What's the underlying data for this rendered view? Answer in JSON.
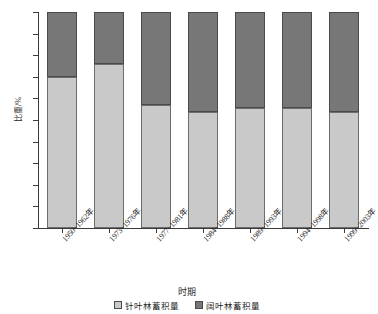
{
  "chart_data": {
    "type": "bar",
    "subtype": "100% stacked bar",
    "title": "",
    "xlabel": "时期",
    "ylabel": "比重/%",
    "ylim": [
      0,
      100
    ],
    "yticks": [
      0,
      10,
      20,
      30,
      40,
      50,
      60,
      70,
      80,
      90,
      100
    ],
    "ytick_labels": [
      "0",
      "10",
      "20",
      "30",
      "40",
      "50",
      "60",
      "70",
      "80",
      "90",
      "100"
    ],
    "grid": false,
    "legend_position": "bottom",
    "categories": [
      "1950~1962年",
      "1973~1976年",
      "1977~1981年",
      "1984~1988年",
      "1989~1993年",
      "1994~1998年",
      "1999~2003年"
    ],
    "series": [
      {
        "name": "针叶林蓄积量",
        "color": "#c9c9c9",
        "values": [
          70,
          76,
          57,
          53.5,
          55.5,
          55.5,
          53.5
        ]
      },
      {
        "name": "阔叶林蓄积量",
        "color": "#777777",
        "values": [
          30,
          24,
          43,
          46.5,
          44.5,
          44.5,
          46.5
        ]
      }
    ]
  },
  "legend": {
    "items": [
      {
        "label": "针叶林蓄积量",
        "swatch": "light-gray-swatch"
      },
      {
        "label": "阔叶林蓄积量",
        "swatch": "dark-gray-swatch"
      }
    ]
  }
}
